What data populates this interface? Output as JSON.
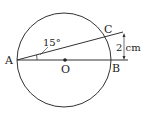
{
  "diagram": {
    "points": {
      "A": {
        "label": "A"
      },
      "B": {
        "label": "B"
      },
      "C": {
        "label": "C"
      },
      "O": {
        "label": "O"
      }
    },
    "angle_label": "15°",
    "distance_label": "2 cm",
    "stroke_color": "#333333"
  }
}
